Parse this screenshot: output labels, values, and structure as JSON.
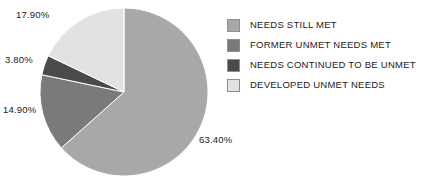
{
  "chart_data": {
    "type": "pie",
    "title": "",
    "categories": [
      "NEEDS STILL MET",
      "FORMER UNMET NEEDS MET",
      "NEEDS CONTINUED TO BE UNMET",
      "DEVELOPED UNMET NEEDS"
    ],
    "values": [
      63.4,
      14.9,
      3.8,
      17.9
    ],
    "value_labels": [
      "63.40%",
      "14.90%",
      "3.80%",
      "17.90%"
    ],
    "colors": [
      "#a8a8a8",
      "#7a7a7a",
      "#4a4a4a",
      "#e2e2e2"
    ],
    "start_angle_deg": 0,
    "direction": "clockwise",
    "legend_position": "right",
    "grid": false,
    "xlabel": "",
    "ylabel": ""
  },
  "labels": {
    "developed_unmet_needs": "17.90%",
    "needs_continued_to_be_unmet": "3.80%",
    "former_unmet_needs_met": "14.90%",
    "needs_still_met": "63.40%"
  },
  "legend": {
    "items": [
      {
        "label": "NEEDS STILL MET",
        "color": "#a8a8a8"
      },
      {
        "label": "FORMER UNMET NEEDS MET",
        "color": "#7a7a7a"
      },
      {
        "label": "NEEDS CONTINUED TO BE UNMET",
        "color": "#4a4a4a"
      },
      {
        "label": "DEVELOPED UNMET NEEDS",
        "color": "#e2e2e2"
      }
    ]
  }
}
